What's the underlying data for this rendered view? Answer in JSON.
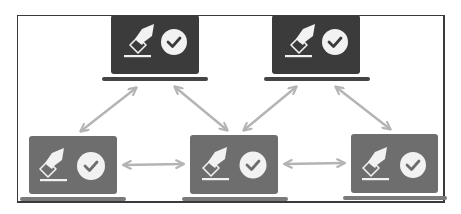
{
  "diagram": {
    "title": "",
    "colors": {
      "frame": "#3a3a3a",
      "background": "#ffffff",
      "top_laptop_screen": "#3b3b3b",
      "top_laptop_base": "#444444",
      "bottom_laptop_screen": "#6e6e6e",
      "bottom_laptop_base": "#7a7a7a",
      "icon": "#f2f2f2",
      "arrow": "#b4b4b4"
    },
    "nodes": [
      {
        "id": "top-left",
        "icon": "vote-ballot-check-icon",
        "shade": "dark"
      },
      {
        "id": "top-right",
        "icon": "vote-ballot-check-icon",
        "shade": "dark"
      },
      {
        "id": "bottom-left",
        "icon": "vote-ballot-check-icon",
        "shade": "medium"
      },
      {
        "id": "bottom-center",
        "icon": "vote-ballot-check-icon",
        "shade": "medium"
      },
      {
        "id": "bottom-right",
        "icon": "vote-ballot-check-icon",
        "shade": "medium"
      }
    ],
    "edges": [
      {
        "from": "top-left",
        "to": "bottom-left",
        "type": "bidirectional"
      },
      {
        "from": "top-left",
        "to": "bottom-center",
        "type": "bidirectional"
      },
      {
        "from": "top-right",
        "to": "bottom-center",
        "type": "bidirectional"
      },
      {
        "from": "top-right",
        "to": "bottom-right",
        "type": "bidirectional"
      },
      {
        "from": "bottom-left",
        "to": "bottom-center",
        "type": "bidirectional"
      },
      {
        "from": "bottom-center",
        "to": "bottom-right",
        "type": "bidirectional"
      }
    ]
  }
}
